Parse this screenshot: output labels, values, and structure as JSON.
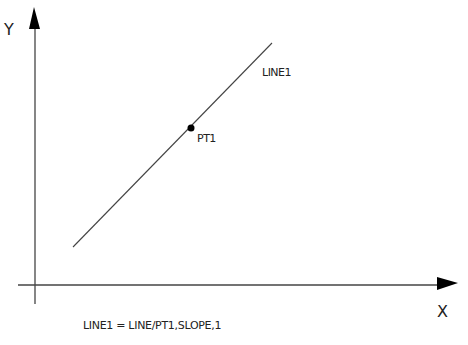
{
  "diagram": {
    "axes": {
      "x_label": "X",
      "y_label": "Y"
    },
    "line": {
      "label": "LINE1",
      "start": [
        73,
        247
      ],
      "end": [
        272,
        43
      ]
    },
    "point": {
      "label": "PT1",
      "position": [
        191,
        128
      ]
    },
    "caption": "LINE1 = LINE/PT1,SLOPE,1",
    "colors": {
      "stroke": "#333333",
      "fill": "#000000",
      "background": "#ffffff"
    }
  }
}
